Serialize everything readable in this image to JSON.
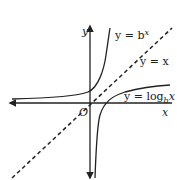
{
  "diagram": {
    "axes": {
      "x_label": "x",
      "y_label": "y",
      "origin_label": "O"
    },
    "curves": [
      {
        "name": "exponential",
        "label": "y = b",
        "label_sup": "x"
      },
      {
        "name": "identity",
        "label": "y = x",
        "style": "dashed"
      },
      {
        "name": "logarithm",
        "label": "y = log",
        "label_sub": "b",
        "label_tail": "x"
      }
    ],
    "colors": {
      "stroke": "#222222",
      "background": "#ffffff"
    }
  }
}
